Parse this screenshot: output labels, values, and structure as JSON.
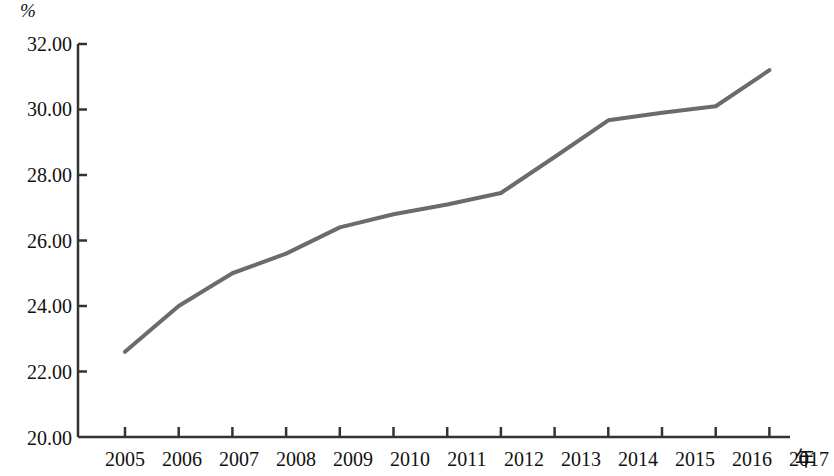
{
  "chart_data": {
    "type": "line",
    "title": "",
    "subtitle": "",
    "xlabel": "年",
    "ylabel": "%",
    "x": [
      2005,
      2006,
      2007,
      2008,
      2009,
      2010,
      2011,
      2012,
      2013,
      2014,
      2015,
      2016,
      2017
    ],
    "categories": [
      "2005",
      "2006",
      "2007",
      "2008",
      "2009",
      "2010",
      "2011",
      "2012",
      "2013",
      "2014",
      "2015",
      "2016",
      "2017"
    ],
    "values": [
      22.6,
      24.0,
      25.0,
      25.6,
      26.4,
      26.8,
      27.1,
      27.45,
      28.55,
      29.67,
      29.9,
      30.1,
      31.2
    ],
    "series": [
      {
        "name": "",
        "values": [
          22.6,
          24.0,
          25.0,
          25.6,
          26.4,
          26.8,
          27.1,
          27.45,
          28.55,
          29.67,
          29.9,
          30.1,
          31.2
        ],
        "color": "#6b6b6b"
      }
    ],
    "ylim": [
      20.0,
      32.0
    ],
    "yticks": [
      20.0,
      22.0,
      24.0,
      26.0,
      28.0,
      30.0,
      32.0
    ],
    "ytick_labels": [
      "20.00",
      "22.00",
      "24.00",
      "26.00",
      "28.00",
      "30.00",
      "32.00"
    ],
    "xlim": [
      2005,
      2017
    ],
    "xticks": [
      2005,
      2006,
      2007,
      2008,
      2009,
      2010,
      2011,
      2012,
      2013,
      2014,
      2015,
      2016,
      2017
    ],
    "xtick_labels": [
      "2005",
      "2006",
      "2007",
      "2008",
      "2009",
      "2010",
      "2011",
      "2012",
      "2013",
      "2014",
      "2015",
      "2016",
      "2017"
    ],
    "grid": false,
    "legend": false,
    "legend_position": "none",
    "markers": false,
    "line_width": 4,
    "axis_color": "#333333",
    "background_color": "#ffffff"
  },
  "axes": {
    "unit_top_left": "%",
    "unit_bottom_right": "年"
  },
  "y_tick_labels": {
    "t0": "32.00",
    "t1": "30.00",
    "t2": "28.00",
    "t3": "26.00",
    "t4": "24.00",
    "t5": "22.00",
    "t6": "20.00"
  },
  "x_tick_labels": {
    "t0": "2005",
    "t1": "2006",
    "t2": "2007",
    "t3": "2008",
    "t4": "2009",
    "t5": "2010",
    "t6": "2011",
    "t7": "2012",
    "t8": "2013",
    "t9": "2014",
    "t10": "2015",
    "t11": "2016",
    "t12": "2017"
  }
}
